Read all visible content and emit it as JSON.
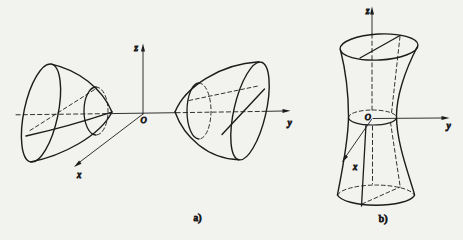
{
  "figure": {
    "background_color": "#f2f2ef",
    "ink_color": "#1c1c1c"
  },
  "panel_a": {
    "caption": "a)",
    "z_label": "z",
    "y_label": "y",
    "x_label": "x",
    "origin_label": "O"
  },
  "panel_b": {
    "caption": "b)",
    "z_label": "z",
    "y_label": "y",
    "x_label": "x",
    "origin_label": "O"
  }
}
